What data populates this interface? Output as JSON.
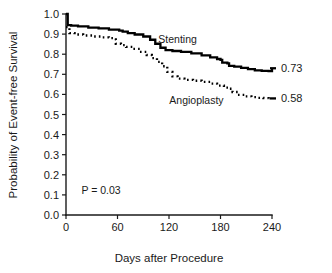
{
  "chart_data": {
    "type": "line",
    "title": "",
    "subtitle": "",
    "xlabel": "Days after Procedure",
    "ylabel": "Probability of Event-free Survival",
    "xlim": [
      0,
      240
    ],
    "ylim": [
      0.0,
      1.0
    ],
    "xticks": [
      0,
      60,
      120,
      180,
      240
    ],
    "xtick_labels": [
      "0",
      "60",
      "120",
      "180",
      "240"
    ],
    "yticks": [
      0.0,
      0.1,
      0.2,
      0.3,
      0.4,
      0.5,
      0.6,
      0.7,
      0.8,
      0.9,
      1.0
    ],
    "ytick_labels": [
      "0.0",
      "0.1",
      "0.2",
      "0.3",
      "0.4",
      "0.5",
      "0.6",
      "0.7",
      "0.8",
      "0.9",
      "1.0"
    ],
    "grid": false,
    "legend_position": "inline-annotation",
    "annotations": [
      {
        "name": "p-value",
        "text": "P = 0.03",
        "x": 18,
        "y": 0.105
      }
    ],
    "series": [
      {
        "name": "Stenting",
        "style": "solid",
        "label_x": 130,
        "label_y": 0.855,
        "endpoint_value": "0.73",
        "endpoint_x": 240,
        "endpoint_y": 0.73,
        "points": [
          [
            0,
            1.0
          ],
          [
            2,
            0.998
          ],
          [
            2,
            0.945
          ],
          [
            6,
            0.942
          ],
          [
            14,
            0.938
          ],
          [
            26,
            0.932
          ],
          [
            38,
            0.928
          ],
          [
            50,
            0.922
          ],
          [
            62,
            0.917
          ],
          [
            66,
            0.912
          ],
          [
            72,
            0.905
          ],
          [
            80,
            0.898
          ],
          [
            90,
            0.888
          ],
          [
            98,
            0.872
          ],
          [
            104,
            0.852
          ],
          [
            110,
            0.832
          ],
          [
            116,
            0.82
          ],
          [
            124,
            0.816
          ],
          [
            134,
            0.812
          ],
          [
            146,
            0.804
          ],
          [
            158,
            0.794
          ],
          [
            168,
            0.784
          ],
          [
            176,
            0.776
          ],
          [
            180,
            0.772
          ],
          [
            182,
            0.758
          ],
          [
            188,
            0.754
          ],
          [
            190,
            0.742
          ],
          [
            196,
            0.738
          ],
          [
            204,
            0.732
          ],
          [
            212,
            0.726
          ],
          [
            220,
            0.72
          ],
          [
            228,
            0.717
          ],
          [
            236,
            0.716
          ],
          [
            240,
            0.73
          ]
        ]
      },
      {
        "name": "Angioplasty",
        "style": "dotted",
        "label_x": 152,
        "label_y": 0.552,
        "endpoint_value": "0.58",
        "endpoint_x": 240,
        "endpoint_y": 0.58,
        "points": [
          [
            0,
            0.935
          ],
          [
            4,
            0.905
          ],
          [
            10,
            0.898
          ],
          [
            20,
            0.893
          ],
          [
            32,
            0.888
          ],
          [
            42,
            0.884
          ],
          [
            50,
            0.88
          ],
          [
            56,
            0.874
          ],
          [
            58,
            0.852
          ],
          [
            64,
            0.845
          ],
          [
            70,
            0.836
          ],
          [
            78,
            0.826
          ],
          [
            86,
            0.812
          ],
          [
            94,
            0.796
          ],
          [
            100,
            0.78
          ],
          [
            106,
            0.762
          ],
          [
            112,
            0.74
          ],
          [
            118,
            0.712
          ],
          [
            124,
            0.69
          ],
          [
            130,
            0.678
          ],
          [
            138,
            0.672
          ],
          [
            148,
            0.668
          ],
          [
            158,
            0.662
          ],
          [
            168,
            0.654
          ],
          [
            176,
            0.644
          ],
          [
            184,
            0.634
          ],
          [
            190,
            0.628
          ],
          [
            194,
            0.612
          ],
          [
            200,
            0.598
          ],
          [
            208,
            0.59
          ],
          [
            216,
            0.586
          ],
          [
            224,
            0.583
          ],
          [
            230,
            0.581
          ],
          [
            236,
            0.58
          ]
        ]
      }
    ]
  }
}
